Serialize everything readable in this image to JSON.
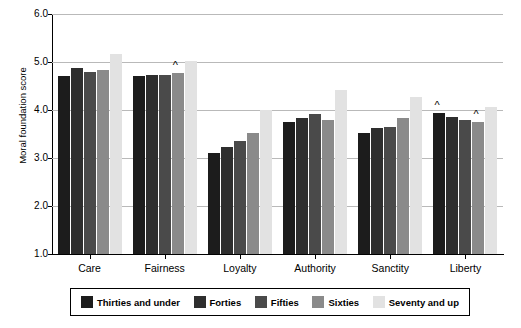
{
  "chart_data": {
    "type": "bar",
    "title": "",
    "xlabel": "",
    "ylabel": "Moral foundation score",
    "ylim": [
      1.0,
      6.0
    ],
    "ytick_labels": [
      "1.0",
      "2.0",
      "3.0",
      "4.0",
      "5.0",
      "6.0"
    ],
    "ytick_values": [
      1.0,
      2.0,
      3.0,
      4.0,
      5.0,
      6.0
    ],
    "grid": true,
    "legend_position": "bottom",
    "categories": [
      "Care",
      "Fairness",
      "Loyalty",
      "Authority",
      "Sanctity",
      "Liberty"
    ],
    "series": [
      {
        "name": "Thirties and under",
        "color": "#1c1c1c",
        "values": [
          4.7,
          4.7,
          3.11,
          3.74,
          3.52,
          3.93
        ]
      },
      {
        "name": "Forties",
        "color": "#2e2e2e",
        "values": [
          4.87,
          4.72,
          3.23,
          3.84,
          3.63,
          3.85
        ]
      },
      {
        "name": "Fifties",
        "color": "#4a4a4a",
        "values": [
          4.79,
          4.73,
          3.35,
          3.92,
          3.65,
          3.8
        ]
      },
      {
        "name": "Sixties",
        "color": "#8a8a8a",
        "values": [
          4.84,
          4.77,
          3.53,
          3.8,
          3.84,
          3.74
        ]
      },
      {
        "name": "Seventy and up",
        "color": "#e2e2e2",
        "values": [
          5.16,
          5.02,
          4.01,
          4.41,
          4.27,
          4.06
        ]
      }
    ],
    "annotations": [
      {
        "text": "^",
        "category": "Fairness",
        "series": "Sixties"
      },
      {
        "text": "^",
        "category": "Liberty",
        "series": "Thirties and under"
      },
      {
        "text": "^",
        "category": "Liberty",
        "series": "Sixties"
      }
    ]
  }
}
